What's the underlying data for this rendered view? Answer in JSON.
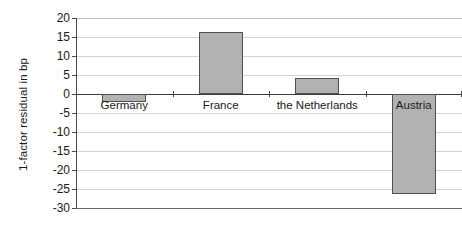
{
  "chart_data": {
    "type": "bar",
    "title": "",
    "subtitle": "",
    "xlabel": "",
    "ylabel": "1-factor residual in bp",
    "categories": [
      "Germany",
      "France",
      "the Netherlands",
      "Austria"
    ],
    "values": [
      -2,
      16.3,
      4.3,
      -26.2
    ],
    "series": [
      {
        "name": "1-factor residual",
        "values": [
          -2,
          16.3,
          4.3,
          -26.2
        ]
      }
    ],
    "ylim": [
      -30,
      20
    ],
    "yticks": [
      20,
      15,
      10,
      5,
      0,
      -5,
      -10,
      -15,
      -20,
      -25,
      -30
    ],
    "ytick_labels": [
      "20",
      "15",
      "10",
      "5",
      "0",
      "-5",
      "-10",
      "-15",
      "-20",
      "-25",
      "-30"
    ],
    "grid": true,
    "grid_axis": "y",
    "legend": false,
    "legend_position": "none",
    "bar_fill_color": "#b2b2b2",
    "bar_edge_color": "#4f4f4f",
    "gridline_color": "#d2d2d2",
    "axis_color": "#3a3a3a",
    "background_color": "#ffffff",
    "annotations": []
  }
}
